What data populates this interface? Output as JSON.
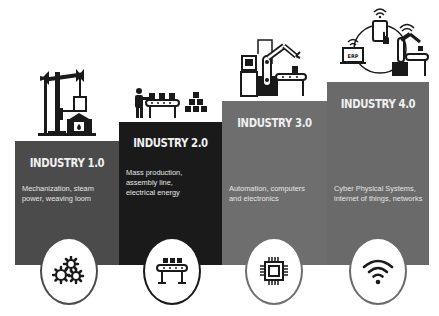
{
  "colors": {
    "background": "#ffffff",
    "industry_1": "#4b4b4b",
    "industry_2": "#1a1a1a",
    "industry_3": "#6e6e6e",
    "industry_4": "#6a6a6a",
    "text": "#f0f0f0",
    "icon": "#1a1a1a"
  },
  "stages": [
    {
      "title": "INDUSTRY 1.0",
      "description": "Mechanization, steam power, weaving loom",
      "illustration": "steam-hammer-furnace-icon",
      "icon": "gears-icon"
    },
    {
      "title": "INDUSTRY 2.0",
      "description": "Mass production, assembly line, electrical energy",
      "illustration": "worker-assembly-line-icon",
      "icon": "conveyor-belt-icon"
    },
    {
      "title": "INDUSTRY 3.0",
      "description": "Automation, computers and electronics",
      "illustration": "computer-robot-arm-icon",
      "icon": "microchip-icon"
    },
    {
      "title": "INDUSTRY 4.0",
      "description": "Cyber Physical Systems, internet of things, networks",
      "illustration": "connected-erp-phone-robot-icon",
      "illustration_label": "ERP",
      "icon": "wifi-icon"
    }
  ]
}
